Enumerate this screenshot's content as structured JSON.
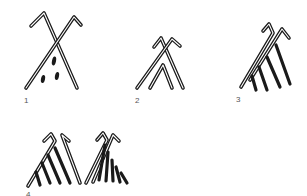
{
  "figure": {
    "ink_color": "#1a1a1a",
    "background_color": "#ffffff",
    "panels": [
      {
        "id": 1,
        "label": "1",
        "motif": "crossed staffs with hooked tops and three drops below"
      },
      {
        "id": 2,
        "label": "2",
        "motif": "crossed staffs with hooked tops and inner chevron"
      },
      {
        "id": 3,
        "label": "3",
        "motif": "paired hooked staffs with four pendant strokes"
      },
      {
        "id": 4,
        "label": "4",
        "motif": "two paired hooked staff signs with multiple pendant strokes"
      }
    ]
  }
}
